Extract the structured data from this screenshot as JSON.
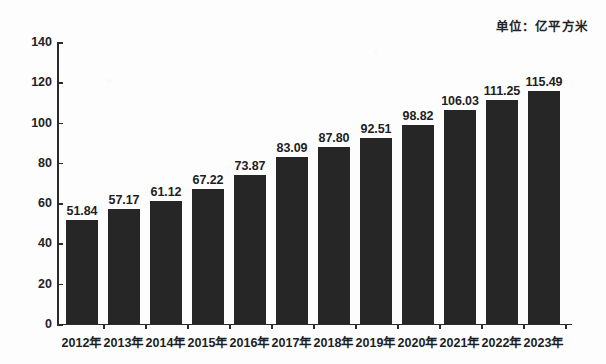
{
  "unit_note": "单位：亿平方米",
  "chart_data": {
    "type": "bar",
    "title": "",
    "subtitle": "",
    "xlabel": "",
    "ylabel": "",
    "unit": "亿平方米",
    "ylim": [
      0,
      140
    ],
    "yticks": [
      0,
      20,
      40,
      60,
      80,
      100,
      120,
      140
    ],
    "grid": false,
    "legend": null,
    "bar_color": "#262626",
    "background_color": "#fdfdfd",
    "axis_color": "#2b2b2b",
    "categories": [
      "2012年",
      "2013年",
      "2014年",
      "2015年",
      "2016年",
      "2017年",
      "2018年",
      "2019年",
      "2020年",
      "2021年",
      "2022年",
      "2023年"
    ],
    "values": [
      51.84,
      57.17,
      61.12,
      67.22,
      73.87,
      83.09,
      87.8,
      92.51,
      98.82,
      106.03,
      111.25,
      115.49
    ],
    "value_labels": [
      "51.84",
      "57.17",
      "61.12",
      "67.22",
      "73.87",
      "83.09",
      "87.80",
      "92.51",
      "98.82",
      "106.03",
      "111.25",
      "115.49"
    ]
  }
}
